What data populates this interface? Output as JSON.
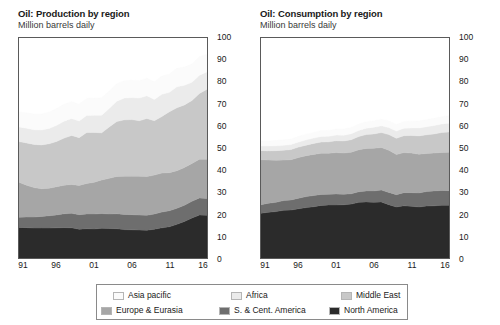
{
  "charts": [
    {
      "title": "Oil: Production by region",
      "subtitle": "Million barrels daily",
      "ylabels": [
        "100",
        "90",
        "80",
        "70",
        "60",
        "50",
        "40",
        "30",
        "20",
        "10",
        "0"
      ],
      "xlabels": [
        "91",
        "96",
        "01",
        "06",
        "11",
        "16"
      ]
    },
    {
      "title": "Oil: Consumption by region",
      "subtitle": "Million barrels daily",
      "ylabels": [
        "100",
        "90",
        "80",
        "70",
        "60",
        "50",
        "40",
        "30",
        "20",
        "10",
        "0"
      ],
      "xlabels": [
        "91",
        "96",
        "01",
        "06",
        "11",
        "16"
      ]
    }
  ],
  "legend": {
    "items": [
      {
        "label": "Asia pacific",
        "color": "#fbfbfb"
      },
      {
        "label": "Africa",
        "color": "#ebebeb"
      },
      {
        "label": "Middle East",
        "color": "#c8c8c8"
      },
      {
        "label": "Europe & Eurasia",
        "color": "#a6a6a6"
      },
      {
        "label": "S. & Cent. America",
        "color": "#6e6e6e"
      },
      {
        "label": "North America",
        "color": "#2b2b2b"
      }
    ]
  },
  "chart_data": [
    {
      "type": "area",
      "title": "Oil: Production by region",
      "subtitle": "Million barrels daily",
      "xlabel": "",
      "ylabel": "Million barrels daily",
      "ylim": [
        0,
        100
      ],
      "yticks": [
        0,
        10,
        20,
        30,
        40,
        50,
        60,
        70,
        80,
        90,
        100
      ],
      "grid": false,
      "legend_position": "bottom",
      "stacked": true,
      "stack_order_bottom_to_top": [
        "North America",
        "S. & Cent. America",
        "Europe & Eurasia",
        "Middle East",
        "Africa",
        "Asia pacific"
      ],
      "x": [
        1991,
        1992,
        1993,
        1994,
        1995,
        1996,
        1997,
        1998,
        1999,
        2000,
        2001,
        2002,
        2003,
        2004,
        2005,
        2006,
        2007,
        2008,
        2009,
        2010,
        2011,
        2012,
        2013,
        2014,
        2015,
        2016
      ],
      "xtick_labels": [
        "91",
        "96",
        "01",
        "06",
        "11",
        "16"
      ],
      "xtick_values": [
        1991,
        1996,
        2001,
        2006,
        2011,
        2016
      ],
      "series": [
        {
          "name": "North America",
          "color": "#2b2b2b",
          "values": [
            13.9,
            13.8,
            13.6,
            13.6,
            13.6,
            13.7,
            13.8,
            13.7,
            13.1,
            13.3,
            13.2,
            13.5,
            13.4,
            13.3,
            12.9,
            12.8,
            12.7,
            12.6,
            13.1,
            13.7,
            14.2,
            15.3,
            16.6,
            18.2,
            19.5,
            19.4
          ]
        },
        {
          "name": "S. & Cent. America",
          "color": "#6e6e6e",
          "values": [
            4.6,
            4.8,
            5.0,
            5.3,
            5.6,
            5.9,
            6.3,
            6.6,
            6.6,
            6.7,
            6.8,
            6.7,
            6.6,
            6.8,
            6.9,
            6.9,
            6.8,
            6.8,
            6.9,
            7.2,
            7.3,
            7.3,
            7.4,
            7.6,
            7.8,
            7.7
          ]
        },
        {
          "name": "Europe & Eurasia",
          "color": "#a6a6a6",
          "values": [
            15.9,
            14.5,
            13.4,
            12.6,
            12.5,
            12.8,
            13.0,
            13.1,
            13.3,
            13.9,
            14.4,
            15.3,
            16.2,
            17.0,
            17.4,
            17.5,
            17.7,
            17.6,
            17.7,
            17.7,
            17.3,
            17.1,
            17.1,
            17.2,
            17.6,
            17.8
          ]
        },
        {
          "name": "Middle East",
          "color": "#c8c8c8",
          "values": [
            18.5,
            19.2,
            19.6,
            19.9,
            20.2,
            20.6,
            21.4,
            22.3,
            21.7,
            23.1,
            22.7,
            21.4,
            23.4,
            24.9,
            25.6,
            25.7,
            25.2,
            26.4,
            24.7,
            25.7,
            27.7,
            28.6,
            28.5,
            28.6,
            29.9,
            31.8
          ]
        },
        {
          "name": "Africa",
          "color": "#ebebeb",
          "values": [
            6.6,
            6.7,
            6.7,
            6.8,
            7.0,
            7.3,
            7.7,
            7.7,
            7.6,
            7.8,
            7.8,
            8.0,
            8.4,
            9.3,
            9.9,
            10.0,
            10.3,
            10.3,
            9.7,
            10.1,
            8.8,
            9.5,
            8.9,
            8.3,
            8.3,
            7.9
          ]
        },
        {
          "name": "Asia pacific",
          "color": "#fbfbfb",
          "values": [
            6.8,
            7.0,
            7.1,
            7.2,
            7.4,
            7.6,
            7.7,
            7.7,
            7.6,
            7.8,
            7.8,
            7.9,
            7.9,
            7.9,
            7.9,
            7.9,
            7.9,
            8.0,
            8.0,
            8.3,
            8.3,
            8.4,
            8.3,
            8.3,
            8.4,
            8.0
          ]
        }
      ],
      "totals": [
        66.3,
        66.0,
        65.4,
        65.4,
        66.3,
        67.9,
        69.9,
        71.1,
        69.9,
        72.6,
        72.7,
        72.8,
        75.9,
        79.2,
        80.6,
        80.8,
        80.6,
        81.7,
        80.1,
        82.7,
        83.6,
        86.2,
        86.8,
        88.2,
        91.5,
        92.6
      ]
    },
    {
      "type": "area",
      "title": "Oil: Consumption by region",
      "subtitle": "Million barrels daily",
      "xlabel": "",
      "ylabel": "Million barrels daily",
      "ylim": [
        0,
        100
      ],
      "yticks": [
        0,
        10,
        20,
        30,
        40,
        50,
        60,
        70,
        80,
        90,
        100
      ],
      "grid": false,
      "legend_position": "bottom",
      "stacked": true,
      "stack_order_bottom_to_top": [
        "North America",
        "S. & Cent. America",
        "Europe & Eurasia",
        "Middle East",
        "Africa",
        "Asia pacific"
      ],
      "x": [
        1991,
        1992,
        1993,
        1994,
        1995,
        1996,
        1997,
        1998,
        1999,
        2000,
        2001,
        2002,
        2003,
        2004,
        2005,
        2006,
        2007,
        2008,
        2009,
        2010,
        2011,
        2012,
        2013,
        2014,
        2015,
        2016
      ],
      "xtick_labels": [
        "91",
        "96",
        "01",
        "06",
        "11",
        "16"
      ],
      "xtick_values": [
        1991,
        1996,
        2001,
        2006,
        2011,
        2016
      ],
      "series": [
        {
          "name": "North America",
          "color": "#2b2b2b",
          "values": [
            20.3,
            20.8,
            21.1,
            21.7,
            21.8,
            22.4,
            22.9,
            23.3,
            23.9,
            24.1,
            24.1,
            24.2,
            24.5,
            25.3,
            25.5,
            25.3,
            25.5,
            24.2,
            23.2,
            23.7,
            23.5,
            23.2,
            23.6,
            23.7,
            24.0,
            24.0
          ]
        },
        {
          "name": "S. & Cent. America",
          "color": "#6e6e6e",
          "values": [
            3.9,
            4.1,
            4.2,
            4.4,
            4.6,
            4.8,
            5.0,
            5.1,
            5.0,
            4.9,
            5.0,
            4.8,
            4.7,
            4.8,
            5.0,
            5.2,
            5.4,
            5.6,
            5.6,
            6.0,
            6.2,
            6.4,
            6.6,
            6.8,
            6.7,
            6.6
          ]
        },
        {
          "name": "Europe & Eurasia",
          "color": "#a6a6a6",
          "values": [
            20.5,
            19.6,
            19.1,
            18.4,
            18.3,
            18.5,
            18.6,
            18.7,
            18.7,
            18.6,
            18.8,
            18.7,
            18.9,
            19.1,
            19.3,
            19.4,
            19.3,
            19.2,
            18.2,
            18.2,
            18.0,
            17.6,
            17.3,
            17.2,
            17.3,
            17.5
          ]
        },
        {
          "name": "Middle East",
          "color": "#c8c8c8",
          "values": [
            4.1,
            4.2,
            4.4,
            4.5,
            4.6,
            4.7,
            4.8,
            5.0,
            5.1,
            5.2,
            5.4,
            5.5,
            5.7,
            6.0,
            6.3,
            6.5,
            6.8,
            7.1,
            7.4,
            7.7,
            8.0,
            8.3,
            8.5,
            8.7,
            9.0,
            9.2
          ]
        },
        {
          "name": "Africa",
          "color": "#ebebeb",
          "values": [
            2.1,
            2.2,
            2.2,
            2.2,
            2.3,
            2.3,
            2.4,
            2.4,
            2.5,
            2.5,
            2.6,
            2.6,
            2.7,
            2.8,
            2.9,
            3.0,
            3.1,
            3.2,
            3.3,
            3.4,
            3.4,
            3.6,
            3.7,
            3.8,
            3.9,
            4.0
          ]
        },
        {
          "name": "Asia pacific",
          "color": "#fbfbfb",
          "values": [
            2.2,
            2.3,
            2.4,
            2.5,
            2.5,
            2.6,
            2.6,
            2.6,
            2.7,
            2.7,
            2.7,
            2.8,
            2.8,
            2.9,
            2.9,
            2.9,
            3.0,
            3.0,
            3.0,
            3.1,
            3.1,
            3.2,
            3.2,
            3.3,
            3.3,
            3.4
          ]
        }
      ],
      "totals": [
        53.1,
        53.2,
        53.4,
        53.7,
        54.1,
        55.3,
        56.3,
        57.1,
        57.9,
        58.0,
        58.6,
        58.6,
        59.3,
        60.9,
        61.9,
        62.3,
        63.1,
        62.3,
        60.7,
        62.1,
        62.2,
        62.3,
        62.9,
        63.5,
        64.2,
        64.7
      ]
    }
  ]
}
